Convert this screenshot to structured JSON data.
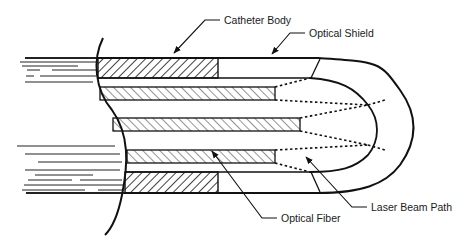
{
  "diagram": {
    "type": "cross-section schematic",
    "labels": {
      "catheter_body": "Catheter Body",
      "optical_shield": "Optical Shield",
      "optical_fiber": "Optical Fiber",
      "laser_beam_path": "Laser Beam Path"
    },
    "components": [
      {
        "id": "catheter_body",
        "label": "Catheter Body",
        "style": "hatched band (top and bottom)"
      },
      {
        "id": "optical_shield",
        "label": "Optical Shield",
        "style": "rounded U-shaped transparent tip"
      },
      {
        "id": "optical_fiber",
        "label": "Optical Fiber",
        "count": 3,
        "style": "hatched strips"
      },
      {
        "id": "laser_beam_path",
        "label": "Laser Beam Path",
        "style": "dotted lines diverging from fiber ends"
      }
    ],
    "colors": {
      "line": "#111111",
      "background": "#ffffff"
    }
  }
}
